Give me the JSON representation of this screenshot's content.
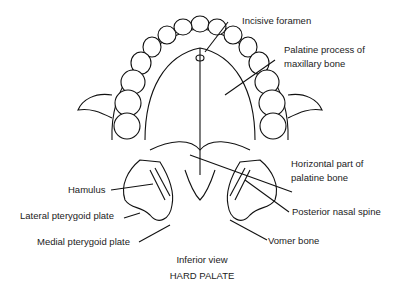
{
  "labels": {
    "incisive_foramen": "Incisive foramen",
    "palatine_process_line1": "Palatine process of",
    "palatine_process_line2": "maxillary bone",
    "horizontal_part_line1": "Horizontal part of",
    "horizontal_part_line2": "palatine bone",
    "posterior_nasal_spine": "Posterior nasal spine",
    "vomer_bone": "Vomer bone",
    "hamulus": "Hamulus",
    "lateral_pterygoid_plate": "Lateral pterygoid plate",
    "medial_pterygoid_plate": "Medial pterygoid plate"
  },
  "caption": {
    "view": "Inferior view",
    "title": "HARD PALATE"
  }
}
